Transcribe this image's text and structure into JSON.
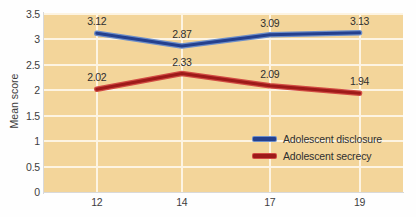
{
  "chart_data": {
    "type": "line",
    "title": "",
    "xlabel": "",
    "ylabel": "Mean score",
    "categories": [
      "12",
      "14",
      "17",
      "19"
    ],
    "x": [
      12,
      14,
      17,
      19
    ],
    "ylim": [
      0,
      3.5
    ],
    "yticks": [
      "0",
      "0.5",
      "1",
      "1.5",
      "2",
      "2.5",
      "3",
      "3.5"
    ],
    "ytick_values": [
      0,
      0.5,
      1,
      1.5,
      2,
      2.5,
      3,
      3.5
    ],
    "grid": true,
    "legend_position": "inside-right",
    "plot_background": "#f3d59a",
    "gridline_color": "#fdf4e2",
    "series": [
      {
        "name": "Adolescent disclosure",
        "color": "#24408e",
        "highlight_color": "#6d8ec9",
        "values": [
          3.12,
          2.87,
          3.09,
          3.13
        ],
        "labels": [
          "3.12",
          "2.87",
          "3.09",
          "3.13"
        ]
      },
      {
        "name": "Adolescent secrecy",
        "color": "#9e1a19",
        "highlight_color": "#d14b43",
        "values": [
          2.02,
          2.33,
          2.09,
          1.94
        ],
        "labels": [
          "2.02",
          "2.33",
          "2.09",
          "1.94"
        ]
      }
    ]
  }
}
